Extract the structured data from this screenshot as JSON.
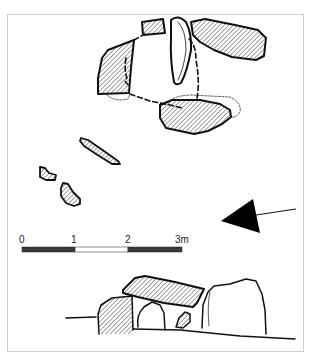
{
  "figure": {
    "type": "archaeological-plan-and-elevation",
    "scale_bar": {
      "labels": [
        "0",
        "1",
        "2",
        "3m"
      ],
      "segments": [
        {
          "fill": "#3a3a3a"
        },
        {
          "fill": "#ffffff"
        },
        {
          "fill": "#3a3a3a"
        }
      ]
    },
    "north_arrow": {
      "color": "#000000"
    },
    "colors": {
      "outline": "#111111",
      "hatch": "#333333",
      "frame": "#cfcfcf"
    }
  }
}
